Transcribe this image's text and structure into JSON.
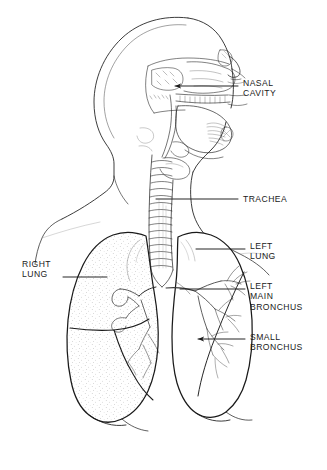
{
  "figure": {
    "background_color": "#ffffff",
    "ink_color": "#1a1a1a",
    "stipple_color": "#808080",
    "width": 327,
    "height": 470
  },
  "labels": [
    {
      "id": "nasal-cavity",
      "text": "NASAL\nCAVITY",
      "side": "right",
      "x": 243,
      "y": 78,
      "leader": {
        "x1": 175,
        "y1": 86,
        "x2": 238,
        "y2": 86,
        "arrow": "left"
      }
    },
    {
      "id": "trachea",
      "text": "TRACHEA",
      "side": "right",
      "x": 243,
      "y": 194,
      "leader": {
        "x1": 156,
        "y1": 199,
        "x2": 238,
        "y2": 199,
        "arrow": "none"
      }
    },
    {
      "id": "left-lung",
      "text": "LEFT\nLUNG",
      "side": "right",
      "x": 250,
      "y": 241,
      "leader": {
        "x1": 196,
        "y1": 249,
        "x2": 245,
        "y2": 249,
        "arrow": "none"
      }
    },
    {
      "id": "left-main-bronchus",
      "text": "LEFT\nMAIN\nBRONCHUS",
      "side": "right",
      "x": 250,
      "y": 281,
      "leader": {
        "x1": 180,
        "y1": 289,
        "x2": 245,
        "y2": 289,
        "arrow": "none"
      }
    },
    {
      "id": "small-bronchus",
      "text": "SMALL\nBRONCHUS",
      "side": "right",
      "x": 250,
      "y": 332,
      "leader": {
        "x1": 198,
        "y1": 339,
        "x2": 245,
        "y2": 339,
        "arrow": "left"
      }
    },
    {
      "id": "right-lung",
      "text": "RIGHT\nLUNG",
      "side": "left",
      "x": 22,
      "y": 259,
      "leader": {
        "x1": 63,
        "y1": 277,
        "x2": 107,
        "y2": 277,
        "arrow": "none"
      }
    }
  ],
  "signature": {
    "text": "",
    "x": 183,
    "y": 432
  }
}
